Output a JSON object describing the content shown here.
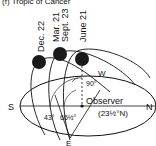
{
  "header": {
    "text": "(f)  Tropic of Cancer"
  },
  "dates": {
    "dec": "Dec. 22",
    "mar": "Mar. 21",
    "sept": "Sept. 23",
    "june": "June 21"
  },
  "directions": {
    "south": "S",
    "north": "N",
    "east": "E",
    "west": "W"
  },
  "angles": {
    "dec": "43°",
    "equinox": "66½°",
    "june": "90°"
  },
  "observer": {
    "label": "Observer",
    "latitude": "(23½°N)"
  },
  "colors": {
    "ink": "#111111",
    "sun": "#1a1a1a",
    "background": "#ffffff"
  }
}
